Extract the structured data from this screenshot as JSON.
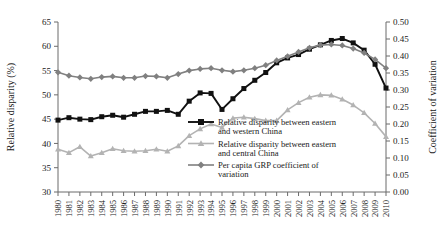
{
  "chart_data": {
    "type": "line",
    "title": "",
    "xlabel": "",
    "ylabel": "Relative disparity (%)",
    "y2label": "Coefficient of variation",
    "grid": false,
    "legend_position": "center",
    "xlim": [
      1980,
      2010
    ],
    "ylim": [
      30,
      65
    ],
    "y2lim": [
      0.0,
      0.5
    ],
    "ytick_labels": [
      "65",
      "60",
      "55",
      "50",
      "45",
      "40",
      "35",
      "30"
    ],
    "ytick_values": [
      65,
      60,
      55,
      50,
      45,
      40,
      35,
      30
    ],
    "y2tick_labels": [
      "0.50",
      "0.45",
      "0.40",
      "0.35",
      "0.30",
      "0.25",
      "0.20",
      "0.15",
      "0.10",
      "0.05",
      "0.00"
    ],
    "y2tick_values": [
      0.5,
      0.45,
      0.4,
      0.35,
      0.3,
      0.25,
      0.2,
      0.15,
      0.1,
      0.05,
      0.0
    ],
    "x": [
      1980,
      1981,
      1982,
      1983,
      1984,
      1985,
      1986,
      1987,
      1988,
      1989,
      1990,
      1991,
      1992,
      1993,
      1994,
      1995,
      1996,
      1997,
      1998,
      1999,
      2000,
      2001,
      2002,
      2003,
      2004,
      2005,
      2006,
      2007,
      2008,
      2009,
      2010
    ],
    "categories": [
      "1980",
      "1981",
      "1982",
      "1983",
      "1984",
      "1985",
      "1986",
      "1987",
      "1988",
      "1989",
      "1990",
      "1991",
      "1992",
      "1993",
      "1994",
      "1995",
      "1996",
      "1997",
      "1998",
      "1999",
      "2000",
      "2001",
      "2002",
      "2003",
      "2004",
      "2005",
      "2006",
      "2007",
      "2008",
      "2009",
      "2010"
    ],
    "series": [
      {
        "name": "Relative disparity between eastern and western China",
        "axis": "left",
        "color": "#111111",
        "marker": "square",
        "values": [
          44.8,
          45.3,
          45.0,
          44.9,
          45.5,
          45.8,
          45.4,
          46.0,
          46.6,
          46.6,
          46.8,
          46.0,
          48.7,
          50.4,
          50.3,
          47.0,
          49.2,
          51.3,
          53.0,
          54.6,
          56.6,
          57.6,
          58.3,
          59.4,
          60.3,
          61.2,
          61.6,
          60.7,
          59.2,
          56.3,
          51.4
        ]
      },
      {
        "name": "Relative disparity between eastern and central China",
        "axis": "left",
        "color": "#b3b3b3",
        "marker": "triangle",
        "values": [
          38.8,
          38.1,
          39.3,
          37.4,
          38.1,
          38.9,
          38.5,
          38.4,
          38.5,
          38.8,
          38.4,
          39.5,
          41.6,
          43.0,
          44.0,
          43.3,
          45.2,
          45.4,
          45.1,
          44.7,
          44.7,
          46.9,
          48.4,
          49.5,
          50.0,
          49.9,
          49.1,
          47.9,
          46.3,
          44.1,
          41.4
        ]
      },
      {
        "name": "Per capita GRP coefficient of variation",
        "axis": "right",
        "color": "#808080",
        "marker": "diamond",
        "values": [
          0.352,
          0.342,
          0.337,
          0.333,
          0.338,
          0.34,
          0.336,
          0.336,
          0.341,
          0.34,
          0.336,
          0.347,
          0.357,
          0.362,
          0.364,
          0.358,
          0.354,
          0.358,
          0.364,
          0.373,
          0.387,
          0.399,
          0.412,
          0.424,
          0.432,
          0.434,
          0.431,
          0.422,
          0.409,
          0.39,
          0.364
        ]
      }
    ],
    "legend": [
      {
        "label_line1": "Relative disparity between eastern",
        "label_line2": "and western China",
        "color": "#111111",
        "marker": "square"
      },
      {
        "label_line1": "Relative disparity between eastern",
        "label_line2": "and central China",
        "color": "#b3b3b3",
        "marker": "triangle"
      },
      {
        "label_line1": "Per capita GRP coefficient of",
        "label_line2": "variation",
        "color": "#808080",
        "marker": "diamond"
      }
    ]
  }
}
